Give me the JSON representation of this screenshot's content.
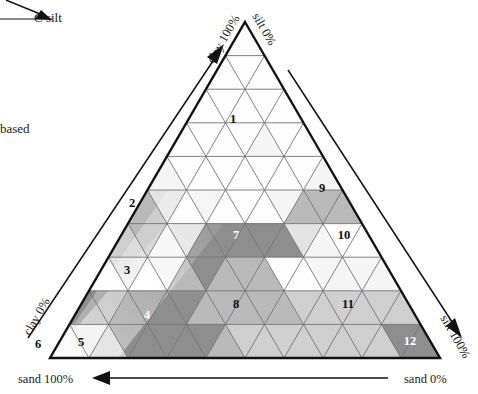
{
  "figure": {
    "type": "ternary-diagram",
    "title_fragments": {
      "top_left_note": "C  silt",
      "left_note": "based"
    }
  },
  "axes": {
    "clay_100": "clay 100%",
    "clay_0": "clay 0%",
    "silt_100": "silt 100%",
    "silt_0": "silt 0%",
    "sand_100": "sand 100%",
    "sand_0": "sand 0%"
  },
  "arrows": {
    "clay_axis_direction": "up-right",
    "silt_axis_direction": "down-right",
    "sand_axis_direction": "right-to-left"
  },
  "colors": {
    "white": "#fdfdfd",
    "near_white": "#f5f5f5",
    "light_grey": "#e3e3e3",
    "mid_light_grey": "#cfcfcf",
    "mid_grey": "#b9b9b9",
    "grey": "#a8a8a8",
    "dark_grey": "#8e8e8e",
    "darker_grey": "#7e7e7e",
    "outline": "#111111",
    "gridline": "#6d6d6d"
  },
  "chart_data": {
    "type": "ternary",
    "title": "",
    "xlabel": "sand",
    "ylabel": "clay",
    "zlabel": "silt",
    "grid": true,
    "divisions": 10,
    "corner_values": {
      "apex": {
        "clay": 100,
        "silt": 0,
        "sand": 0
      },
      "bottom_left": {
        "clay": 0,
        "silt": 0,
        "sand": 100
      },
      "bottom_right": {
        "clay": 0,
        "silt": 100,
        "sand": 0
      }
    },
    "legend": [],
    "class_labels": [
      {
        "id": "1",
        "row": 3,
        "col_index": 4,
        "upright": true,
        "text_color": "light"
      },
      {
        "id": "2",
        "row": 5,
        "col_index": 1,
        "upright": true,
        "text_color": "light"
      },
      {
        "id": "3",
        "row": 7,
        "col_index": 1,
        "upright": true,
        "text_color": "light"
      },
      {
        "id": "4",
        "row": 8,
        "col_index": 3,
        "upright": true,
        "text_color": "dark"
      },
      {
        "id": "5",
        "row": 9,
        "col_index": 1,
        "upright": true,
        "text_color": "light"
      },
      {
        "id": "6",
        "row": 9,
        "col_index": 0,
        "upright": true,
        "text_color": "light"
      },
      {
        "id": "7",
        "row": 6,
        "col_index": 3,
        "upright": true,
        "text_color": "dark"
      },
      {
        "id": "8",
        "row": 8,
        "col_index": 4,
        "upright": true,
        "text_color": "light"
      },
      {
        "id": "9",
        "row": 5,
        "col_index": 4,
        "upright": true,
        "text_color": "light"
      },
      {
        "id": "10",
        "row": 6,
        "col_index": 5,
        "upright": true,
        "text_color": "light"
      },
      {
        "id": "11",
        "row": 8,
        "col_index": 6,
        "upright": true,
        "text_color": "light"
      },
      {
        "id": "12",
        "row": 9,
        "col_index": 8,
        "upright": true,
        "text_color": "dark"
      }
    ],
    "label_positions": [
      {
        "id": "1",
        "x": 233,
        "y": 123
      },
      {
        "id": "2",
        "x": 132,
        "y": 207
      },
      {
        "id": "3",
        "x": 127,
        "y": 274
      },
      {
        "id": "4",
        "x": 147,
        "y": 319
      },
      {
        "id": "5",
        "x": 81,
        "y": 346
      },
      {
        "id": "6",
        "x": 38,
        "y": 348
      },
      {
        "id": "7",
        "x": 236,
        "y": 239
      },
      {
        "id": "8",
        "x": 236,
        "y": 308
      },
      {
        "id": "9",
        "x": 322,
        "y": 192
      },
      {
        "id": "10",
        "x": 344,
        "y": 239
      },
      {
        "id": "11",
        "x": 348,
        "y": 308
      },
      {
        "id": "12",
        "x": 410,
        "y": 345
      }
    ],
    "row_shading": [
      {
        "row": 0,
        "fill": "#fdfdfd"
      },
      {
        "row": 1,
        "fill": "#fdfdfd"
      },
      {
        "row": 2,
        "fill": "#fbfbfb"
      },
      {
        "row": 3,
        "fill": "#fbfbfb"
      },
      {
        "row": 4,
        "fill": "#fafafa"
      },
      {
        "row": 5,
        "fill": "#f7f7f7"
      },
      {
        "row": 6,
        "fill": "#f2f2f2"
      },
      {
        "row": 7,
        "fill": "#f2f2f2"
      },
      {
        "row": 8,
        "fill": "#ededed"
      },
      {
        "row": 9,
        "fill": "#e9e9e9"
      }
    ]
  }
}
